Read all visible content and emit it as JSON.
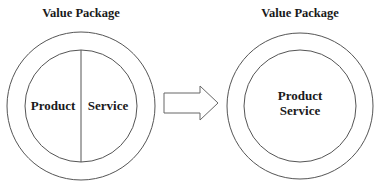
{
  "diagram": {
    "left_panel": {
      "title": "Value Package",
      "segments": [
        {
          "label": "Product"
        },
        {
          "label": "Service"
        }
      ],
      "layout": "split"
    },
    "transition": {
      "icon": "right-arrow-icon"
    },
    "right_panel": {
      "title": "Value Package",
      "lines": [
        "Product",
        "Service"
      ],
      "layout": "integrated"
    },
    "colors": {
      "stroke": "#555555",
      "text": "#1a1a1a",
      "background": "#ffffff"
    }
  }
}
